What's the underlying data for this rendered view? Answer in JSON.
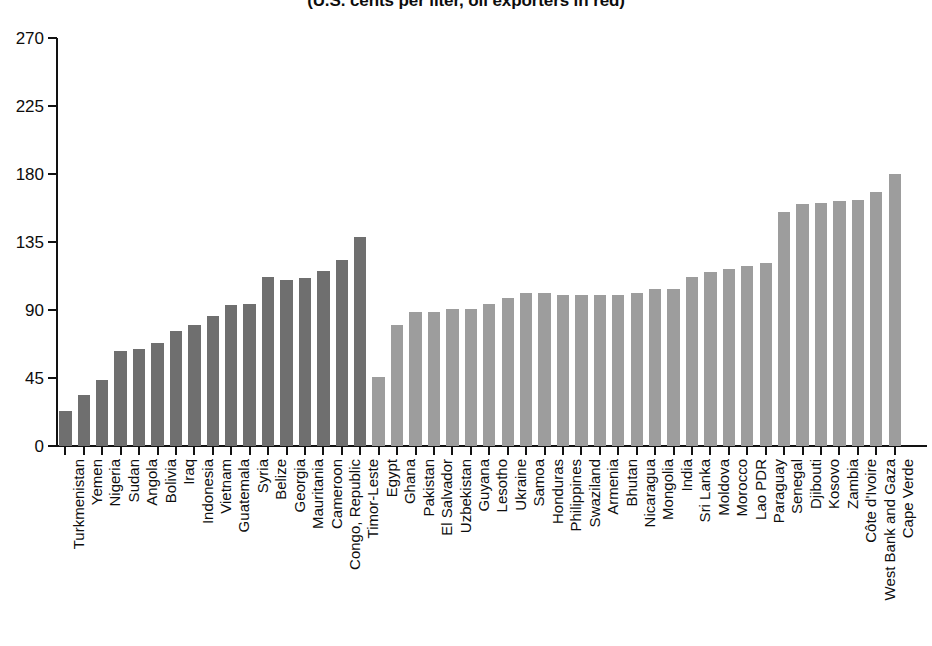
{
  "chart_data": {
    "type": "bar",
    "title": "(U.S. cents per liter, oil exporters in red)",
    "xlabel": "",
    "ylabel": "",
    "ylim": [
      0,
      270
    ],
    "yticks": [
      0,
      45,
      90,
      135,
      180,
      225,
      270
    ],
    "grid": false,
    "legend": "none",
    "legend_note": "oil exporters in red",
    "colors": {
      "oil_exporter": "#6f6f6f",
      "oil_importer": "#9d9d9d",
      "axis": "#121212",
      "text": "#0d0d0d",
      "background": "#ffffff"
    },
    "categories": [
      "Turkmenistan",
      "Yemen",
      "Nigeria",
      "Sudan",
      "Angola",
      "Bolivia",
      "Iraq",
      "Indonesia",
      "Vietnam",
      "Guatemala",
      "Syria",
      "Belize",
      "Georgia",
      "Mauritania",
      "Cameroon",
      "Congo, Republic",
      "Timor-Leste",
      "Egypt",
      "Ghana",
      "Pakistan",
      "El Salvador",
      "Uzbekistan",
      "Guyana",
      "Lesotho",
      "Ukraine",
      "Samoa",
      "Honduras",
      "Philippines",
      "Swaziland",
      "Armenia",
      "Bhutan",
      "Nicaragua",
      "Mongolia",
      "India",
      "Sri Lanka",
      "Moldova",
      "Morocco",
      "Lao PDR",
      "Paraguay",
      "Senegal",
      "Djibouti",
      "Kosovo",
      "Zambia",
      "Côte d'Ivoire",
      "West Bank and Gaza",
      "Cape Verde"
    ],
    "values": [
      23,
      34,
      44,
      63,
      64,
      68,
      76,
      80,
      86,
      93,
      94,
      112,
      110,
      111,
      116,
      123,
      138,
      46,
      80,
      89,
      89,
      91,
      91,
      94,
      98,
      101,
      101,
      100,
      100,
      100,
      100,
      101,
      104,
      104,
      112,
      115,
      117,
      119,
      121,
      155,
      160,
      161,
      162,
      163,
      168,
      180
    ],
    "series_group": [
      "exporter",
      "exporter",
      "exporter",
      "exporter",
      "exporter",
      "exporter",
      "exporter",
      "exporter",
      "exporter",
      "exporter",
      "exporter",
      "exporter",
      "exporter",
      "exporter",
      "exporter",
      "exporter",
      "exporter",
      "importer",
      "importer",
      "importer",
      "importer",
      "importer",
      "importer",
      "importer",
      "importer",
      "importer",
      "importer",
      "importer",
      "importer",
      "importer",
      "importer",
      "importer",
      "importer",
      "importer",
      "importer",
      "importer",
      "importer",
      "importer",
      "importer",
      "importer",
      "importer",
      "importer",
      "importer",
      "importer",
      "importer",
      "importer"
    ]
  }
}
